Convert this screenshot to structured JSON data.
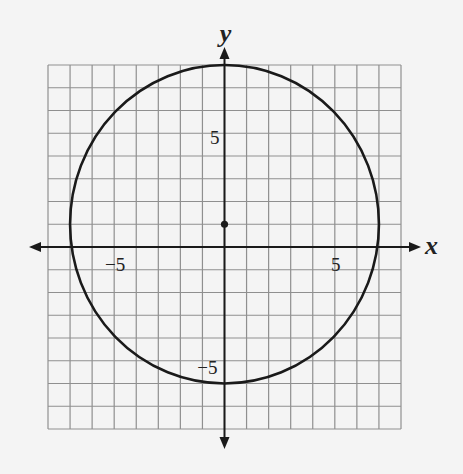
{
  "chart_data": {
    "type": "line",
    "title": "",
    "xlabel": "x",
    "ylabel": "y",
    "xlim": [
      -8,
      8
    ],
    "ylim": [
      -8,
      8
    ],
    "grid": true,
    "grid_step": 1,
    "x_tick_labels": [
      {
        "value": -5,
        "label": "−5"
      },
      {
        "value": 5,
        "label": "5"
      }
    ],
    "y_tick_labels": [
      {
        "value": 5,
        "label": "5"
      },
      {
        "value": -5,
        "label": "−5"
      }
    ],
    "series": [
      {
        "name": "circle",
        "shape": "circle",
        "center": [
          0,
          1
        ],
        "radius": 7,
        "equation": "x^2 + (y - 1)^2 = 49"
      }
    ],
    "points": [
      {
        "name": "center",
        "x": 0,
        "y": 1
      }
    ],
    "legend": null
  },
  "colors": {
    "background": "#f4f4f4",
    "grid": "#8f8f8f",
    "axis": "#1a1a1a",
    "curve": "#1a1a1a"
  }
}
